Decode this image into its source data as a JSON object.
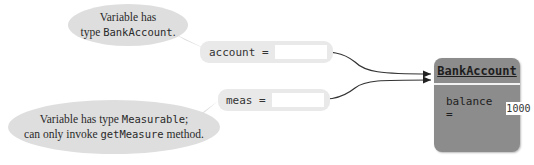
{
  "callouts": {
    "top": {
      "line1": "Variable has",
      "line2_prefix": "type ",
      "line2_code": "BankAccount",
      "line2_suffix": "."
    },
    "bottom": {
      "line1_prefix": "Variable has type ",
      "line1_code": "Measurable",
      "line1_suffix": ";",
      "line2_prefix": "can only invoke ",
      "line2_code": "getMeasure",
      "line2_suffix": " method."
    }
  },
  "variables": [
    {
      "name": "account ="
    },
    {
      "name": "meas ="
    }
  ],
  "object": {
    "class_name": "BankAccount",
    "fields": [
      {
        "name": "balance =",
        "value": "1000"
      }
    ]
  },
  "colors": {
    "bubble": "#dedede",
    "object_fill": "#8c8c8c",
    "variable_fill": "#e9e9e9"
  }
}
